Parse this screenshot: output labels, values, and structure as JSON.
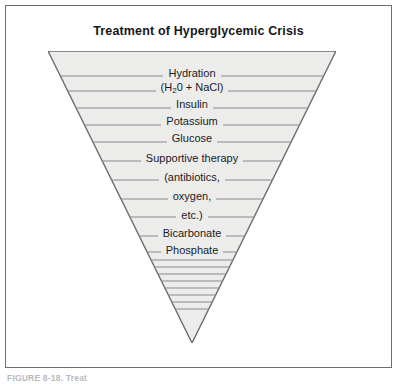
{
  "figure": {
    "title": "Treatment of Hyperglycemic Crisis",
    "caption": "FIGURE 8-18.   Treat",
    "frame_border_color": "#6e6e6e",
    "background_color": "#ffffff"
  },
  "funnel": {
    "fill_color": "#ececeb",
    "outline_color": "#6b6b6b",
    "divider_color": "#8a8a8a",
    "top_width_px": 288,
    "apex_y_px": 292,
    "labels": [
      {
        "id": "hydration",
        "text": "Hydration",
        "y": 17
      },
      {
        "id": "hydration-formula",
        "text": "(H₂0 + NaCl)",
        "y": 31,
        "has_subscript": true,
        "formula_prefix": "(H",
        "formula_sub": "2",
        "formula_suffix": "0 + NaCl)"
      },
      {
        "id": "insulin",
        "text": "Insulin",
        "y": 48
      },
      {
        "id": "potassium",
        "text": "Potassium",
        "y": 65
      },
      {
        "id": "glucose",
        "text": "Glucose",
        "y": 82
      },
      {
        "id": "supportive-therapy",
        "text": "Supportive  therapy",
        "y": 102
      },
      {
        "id": "antibiotics",
        "text": "(antibiotics,",
        "y": 121
      },
      {
        "id": "oxygen",
        "text": "oxygen,",
        "y": 140
      },
      {
        "id": "etc",
        "text": "etc.)",
        "y": 159
      },
      {
        "id": "bicarbonate",
        "text": "Bicarbonate",
        "y": 177
      },
      {
        "id": "phosphate",
        "text": "Phosphate",
        "y": 194
      }
    ],
    "divider_y_positions": [
      25,
      40,
      57,
      74,
      91,
      110,
      129,
      148,
      166,
      185,
      201,
      209,
      216,
      223,
      230,
      237,
      244,
      251,
      258
    ]
  }
}
